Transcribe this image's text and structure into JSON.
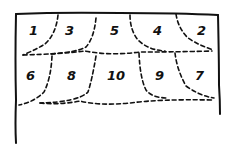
{
  "diagram": {
    "type": "hand-drawn partition diagram",
    "colors": {
      "ink": "#111111",
      "background": "#ffffff"
    },
    "frame": {
      "open_bottom": true,
      "left_side_longer": true
    },
    "rows": [
      {
        "name": "top-row",
        "cells": [
          "1",
          "3",
          "5",
          "4",
          "2"
        ]
      },
      {
        "name": "bottom-row",
        "cells": [
          "6",
          "8",
          "10",
          "9",
          "7"
        ]
      }
    ]
  }
}
